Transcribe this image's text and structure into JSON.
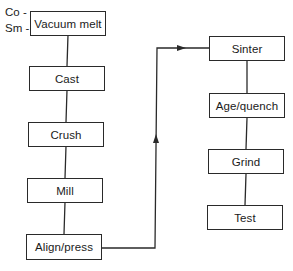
{
  "diagram": {
    "type": "process-flowchart",
    "inputs": [
      {
        "id": "co",
        "label": "Co -"
      },
      {
        "id": "sm",
        "label": "Sm -"
      }
    ],
    "left_column": [
      {
        "id": "vacuum-melt",
        "label": "Vacuum melt"
      },
      {
        "id": "cast",
        "label": "Cast"
      },
      {
        "id": "crush",
        "label": "Crush"
      },
      {
        "id": "mill",
        "label": "Mill"
      },
      {
        "id": "align-press",
        "label": "Align/press"
      }
    ],
    "right_column": [
      {
        "id": "sinter",
        "label": "Sinter"
      },
      {
        "id": "age-quench",
        "label": "Age/quench"
      },
      {
        "id": "grind",
        "label": "Grind"
      },
      {
        "id": "test",
        "label": "Test"
      }
    ],
    "edges": [
      [
        "vacuum-melt",
        "cast"
      ],
      [
        "cast",
        "crush"
      ],
      [
        "crush",
        "mill"
      ],
      [
        "mill",
        "align-press"
      ],
      [
        "align-press",
        "sinter"
      ],
      [
        "sinter",
        "age-quench"
      ],
      [
        "age-quench",
        "grind"
      ],
      [
        "grind",
        "test"
      ]
    ],
    "colors": {
      "line": "#2a2a2a",
      "background": "#ffffff"
    }
  }
}
